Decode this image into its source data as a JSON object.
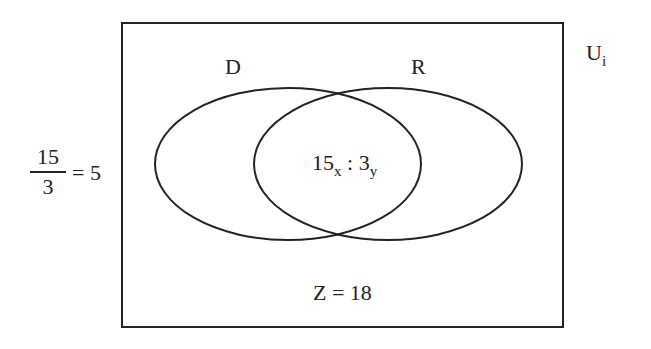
{
  "diagram": {
    "type": "venn",
    "universe_label": {
      "main": "U",
      "sub": "i"
    },
    "sets": [
      {
        "label": "D"
      },
      {
        "label": "R"
      }
    ],
    "intersection": {
      "a_value": "15",
      "a_sub": "x",
      "separator": " : ",
      "b_value": "3",
      "b_sub": "y"
    },
    "outside": "Z = 18",
    "ratio": {
      "numerator": "15",
      "denominator": "3",
      "result": "= 5"
    },
    "colors": {
      "stroke": "#222222",
      "background": "#ffffff"
    }
  }
}
